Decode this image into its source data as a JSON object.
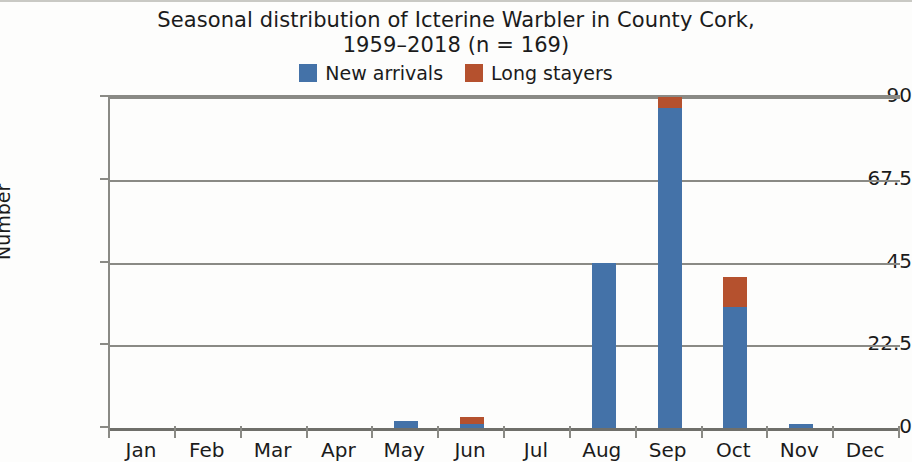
{
  "chart_data": {
    "type": "bar",
    "stacked": true,
    "title": "Seasonal distribution of Icterine Warbler in County Cork, 1959–2018 (n = 169)",
    "title_lines": [
      "Seasonal distribution of Icterine Warbler in County Cork,",
      "1959–2018 (n = 169)"
    ],
    "xlabel": "",
    "ylabel": "Number",
    "ylim": [
      0,
      90
    ],
    "yticks": [
      0,
      22.5,
      45,
      67.5,
      90
    ],
    "ytick_labels": [
      "0",
      "22.5",
      "45",
      "67.5",
      "90"
    ],
    "categories": [
      "Jan",
      "Feb",
      "Mar",
      "Apr",
      "May",
      "Jun",
      "Jul",
      "Aug",
      "Sep",
      "Oct",
      "Nov",
      "Dec"
    ],
    "series": [
      {
        "name": "New arrivals",
        "color": "#4472A8",
        "values": [
          0,
          0,
          0,
          0,
          2,
          1,
          0,
          45,
          87,
          33,
          1,
          0
        ]
      },
      {
        "name": "Long stayers",
        "color": "#B5512E",
        "values": [
          0,
          0,
          0,
          0,
          0,
          2,
          0,
          0,
          3,
          8,
          0,
          0
        ]
      }
    ],
    "grid": "horizontal",
    "legend_position": "top-center",
    "total_n": 169
  },
  "legend": {
    "entries": [
      {
        "label": "New arrivals",
        "color": "#4472A8",
        "swatch_name": "legend-swatch-new-arrivals"
      },
      {
        "label": "Long stayers",
        "color": "#B5512E",
        "swatch_name": "legend-swatch-long-stayers"
      }
    ]
  }
}
